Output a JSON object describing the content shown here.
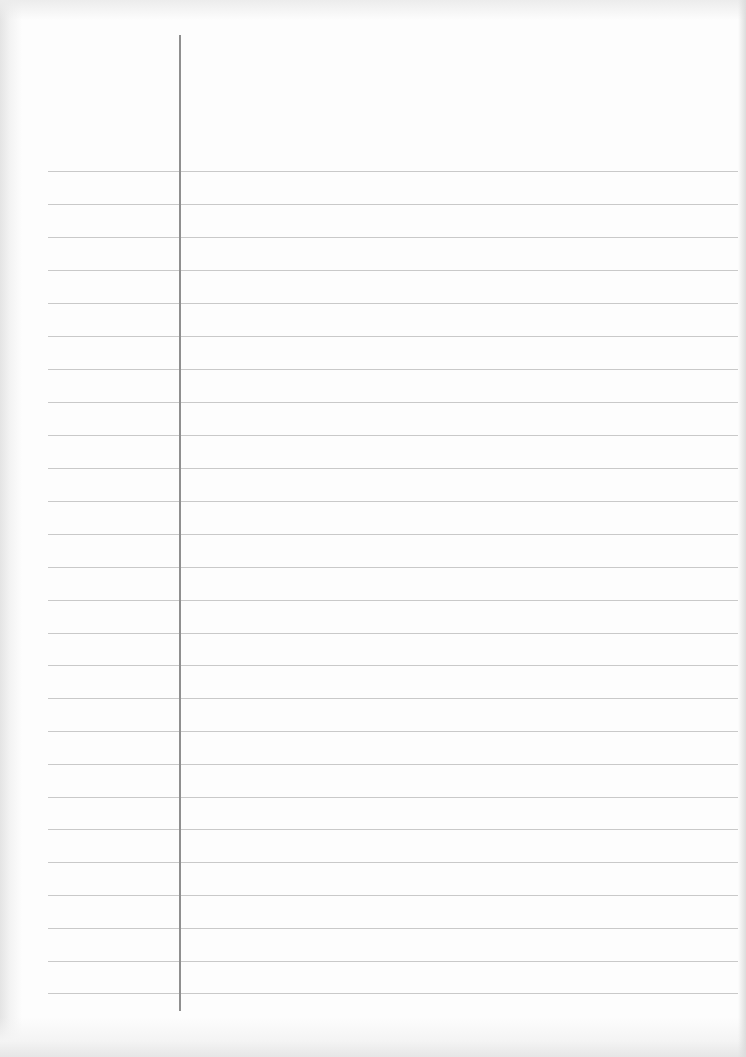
{
  "page": {
    "type": "ruled-notebook-page",
    "background_color": "#fdfdfd",
    "rule_color": "#c9c9c9",
    "margin_line_color": "#8f8f8f",
    "rule_count": 26,
    "rules_y": [
      171,
      204,
      237,
      270,
      303,
      336,
      369,
      402,
      435,
      468,
      501,
      534,
      567,
      600,
      633,
      665,
      698,
      731,
      764,
      797,
      829,
      862,
      895,
      928,
      961,
      993
    ],
    "text_lines": []
  }
}
